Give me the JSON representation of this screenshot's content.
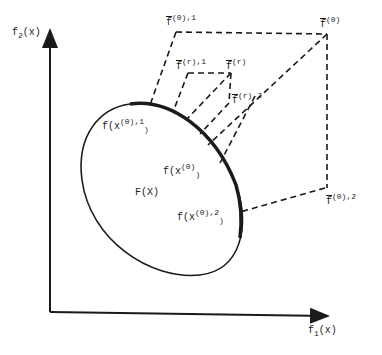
{
  "diagram": {
    "axes": {
      "x_label": {
        "base": "f",
        "sub": "1",
        "rest": "(x)"
      },
      "y_label": {
        "base": "f",
        "sub": "2",
        "rest": "(x)"
      }
    },
    "region_label": "F(X)",
    "points": {
      "f0_1": {
        "base": "f",
        "sup": "(0),1"
      },
      "f0": {
        "base": "f",
        "sup": "(0)"
      },
      "fr_1": {
        "base": "f",
        "sup": "(r),1"
      },
      "fr": {
        "base": "f",
        "sup": "(r)"
      },
      "fr_2": {
        "base": "f",
        "sup": "(r),2"
      },
      "f0_2": {
        "base": "f",
        "sup": "(0),2"
      }
    },
    "curve_labels": {
      "fx0_1": {
        "pre": "f(x",
        "sup": "(0),1",
        "post": ")"
      },
      "fx0": {
        "pre": "f(x",
        "sup": "(0)",
        "post": ")"
      },
      "fx0_2": {
        "pre": "f(x",
        "sup": "(0),2",
        "post": ")"
      }
    },
    "colors": {
      "ink": "#1a1a1a",
      "background": "#ffffff"
    }
  }
}
